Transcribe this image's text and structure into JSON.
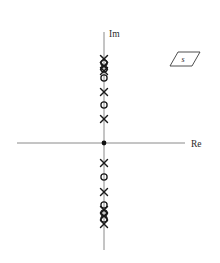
{
  "figure": {
    "kind": "pole-zero-plot",
    "plane_badge": {
      "label": "s",
      "shape": "parallelogram"
    }
  },
  "axes": {
    "imaginary": {
      "label": "Im",
      "orientation": "vertical",
      "x_px": 104,
      "y_start_px": 32,
      "y_end_px": 250,
      "color": "#8a8a8a"
    },
    "real": {
      "label": "Re",
      "orientation": "horizontal",
      "y_px": 143,
      "x_start_px": 17,
      "x_end_px": 185,
      "color": "#8a8a8a"
    },
    "origin": {
      "x_px": 104,
      "y_px": 143,
      "marker": "filled-dot"
    }
  },
  "chart_data": {
    "type": "scatter",
    "title": "",
    "subtitle": "",
    "xlabel": "Re",
    "ylabel": "Im",
    "grid": false,
    "legend": null,
    "annotations": [
      {
        "text": "s",
        "role": "plane-label",
        "x_px": 181,
        "y_px": 60
      }
    ],
    "marker_legend": {
      "pole": "x",
      "zero": "o",
      "origin": "filled-dot"
    },
    "axis_ranges": {
      "x_px": [
        17,
        185
      ],
      "y_px": [
        32,
        250
      ]
    },
    "series": [
      {
        "name": "poles",
        "marker": "x",
        "color": "#1a1a1a",
        "points": [
          {
            "x_px": 104,
            "y_px": 59
          },
          {
            "x_px": 104,
            "y_px": 66
          },
          {
            "x_px": 104,
            "y_px": 71
          },
          {
            "x_px": 104,
            "y_px": 92
          },
          {
            "x_px": 104,
            "y_px": 119
          },
          {
            "x_px": 104,
            "y_px": 163
          },
          {
            "x_px": 104,
            "y_px": 192
          },
          {
            "x_px": 104,
            "y_px": 210
          },
          {
            "x_px": 104,
            "y_px": 216
          },
          {
            "x_px": 104,
            "y_px": 224
          }
        ]
      },
      {
        "name": "zeros",
        "marker": "o",
        "color": "#1a1a1a",
        "points": [
          {
            "x_px": 104,
            "y_px": 63
          },
          {
            "x_px": 104,
            "y_px": 69
          },
          {
            "x_px": 104,
            "y_px": 78
          },
          {
            "x_px": 104,
            "y_px": 105
          },
          {
            "x_px": 104,
            "y_px": 177
          },
          {
            "x_px": 104,
            "y_px": 205
          },
          {
            "x_px": 104,
            "y_px": 213
          },
          {
            "x_px": 104,
            "y_px": 219
          }
        ]
      },
      {
        "name": "origin",
        "marker": "filled-dot",
        "color": "#111111",
        "points": [
          {
            "x_px": 104,
            "y_px": 143
          }
        ]
      }
    ]
  }
}
